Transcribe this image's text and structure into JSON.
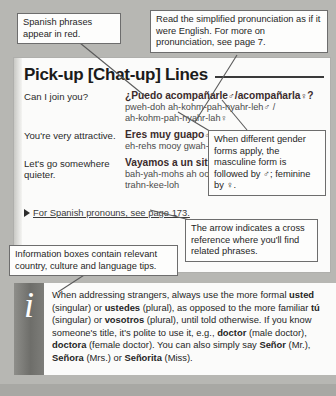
{
  "page": {
    "title": "Pick-up [Chat-up] Lines"
  },
  "phrases": [
    {
      "english": "Can I join you?",
      "spanish_pre": "¿Puedo acompañarle",
      "male_symbol": "♂",
      "spanish_mid": "/acompañarla",
      "female_symbol": "♀",
      "spanish_post": "?",
      "pron_line1": "pweh-doh ah-kohm-pah-nyahr-leh",
      "pron_line1_sym": "♂ /",
      "pron_line2": "ah-kohm-pah-nyahr-lah",
      "pron_line2_sym": "♀"
    },
    {
      "english": "You're very attractive.",
      "spanish_pre": "Eres muy guapo",
      "male_symbol": "♂",
      "spanish_mid": "/",
      "female_symbol": "",
      "spanish_post": "",
      "pron_line1": "eh-rehs mooy gwah-poh",
      "pron_line1_sym": "",
      "pron_line2": "",
      "pron_line2_sym": ""
    },
    {
      "english": "Let's go somewhere quieter.",
      "spanish_pre": "Vayamos a un sitio",
      "male_symbol": "",
      "spanish_mid": "",
      "female_symbol": "",
      "spanish_post": "",
      "pron_line1": "bah-yah-mohs ah oon see-teeyoh mahs",
      "pron_line1_sym": "",
      "pron_line2": "trahn-kee-loh",
      "pron_line2_sym": ""
    }
  ],
  "cross_reference": {
    "arrow": "▶",
    "text": "For Spanish pronouns, see page 173."
  },
  "info_box": {
    "icon": "i",
    "text_parts": [
      {
        "t": "When addressing strangers, always use the more formal ",
        "b": false
      },
      {
        "t": "usted",
        "b": true
      },
      {
        "t": " (singular) or ",
        "b": false
      },
      {
        "t": "ustedes",
        "b": true
      },
      {
        "t": " (plural), as opposed to the more familiar ",
        "b": false
      },
      {
        "t": "tú",
        "b": true
      },
      {
        "t": " (singular) or ",
        "b": false
      },
      {
        "t": "vosotros",
        "b": true
      },
      {
        "t": " (plural), until told otherwise. If you know someone's title, it's polite to use it, e.g., ",
        "b": false
      },
      {
        "t": "doctor",
        "b": true
      },
      {
        "t": " (male doctor), ",
        "b": false
      },
      {
        "t": "doctora",
        "b": true
      },
      {
        "t": " (female doctor). You can also simply say ",
        "b": false
      },
      {
        "t": "Señor",
        "b": true
      },
      {
        "t": " (Mr.), ",
        "b": false
      },
      {
        "t": "Señora",
        "b": true
      },
      {
        "t": " (Mrs.) or ",
        "b": false
      },
      {
        "t": "Señorita",
        "b": true
      },
      {
        "t": " (Miss).",
        "b": false
      }
    ]
  },
  "callouts": {
    "red_phrases": "Spanish phrases appear in red.",
    "pronunciation": "Read the simplified pronunciation as if it were English. For more on pronunciation, see page 7.",
    "gender_pre": "When different gender forms apply, the masculine form is followed by ",
    "gender_male": "♂",
    "gender_mid": "; feminine by ",
    "gender_female": "♀",
    "gender_post": ".",
    "arrow_note": "The arrow indicates a cross reference where you'll find related phrases.",
    "info_note": "Information boxes contain relevant country, culture and language tips."
  },
  "colors": {
    "spanish_red": "#3b2c2c",
    "page_background": "#b7b7b3",
    "sheet": "#fbfbfa",
    "callout_border": "#6d6d6d",
    "info_band": "#6e6e6a"
  }
}
